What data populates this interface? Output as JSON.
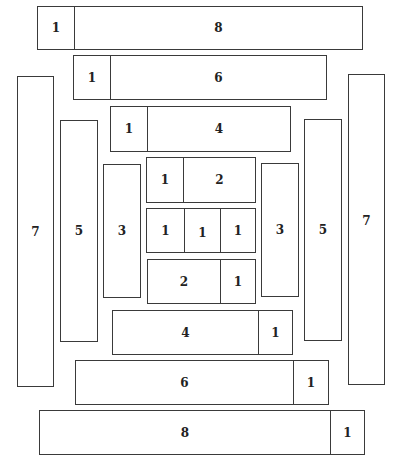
{
  "diagram": {
    "top_bars": [
      {
        "cells": [
          "1",
          "8"
        ]
      },
      {
        "cells": [
          "1",
          "6"
        ]
      },
      {
        "cells": [
          "1",
          "4"
        ]
      }
    ],
    "left_columns": [
      {
        "label": "7"
      },
      {
        "label": "5"
      },
      {
        "label": "3"
      }
    ],
    "center": [
      {
        "cells": [
          "1",
          "2"
        ]
      },
      {
        "cells": [
          "1",
          "1",
          "1"
        ]
      },
      {
        "cells": [
          "2",
          "1"
        ]
      }
    ],
    "right_columns": [
      {
        "label": "3"
      },
      {
        "label": "5"
      },
      {
        "label": "7"
      }
    ],
    "bottom_bars": [
      {
        "cells": [
          "4",
          "1"
        ]
      },
      {
        "cells": [
          "6",
          "1"
        ]
      },
      {
        "cells": [
          "8",
          "1"
        ]
      }
    ]
  }
}
